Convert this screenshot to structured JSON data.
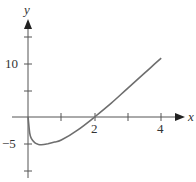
{
  "chart_data": {
    "type": "line",
    "title": "",
    "xlabel": "x",
    "ylabel": "y",
    "xlim": [
      -0.8,
      4.8
    ],
    "ylim": [
      -11,
      18.5
    ],
    "x_ticks": [
      1,
      2,
      3,
      4
    ],
    "x_tick_labels": [
      "",
      "2",
      "",
      "4"
    ],
    "y_ticks": [
      -10,
      -5,
      5,
      10,
      15
    ],
    "y_tick_labels": [
      "",
      "-5",
      "",
      "10",
      ""
    ],
    "grid": false,
    "legend": null,
    "series": [
      {
        "name": "f(x)",
        "x": [
          0.01,
          0.05,
          0.1,
          0.2,
          0.3,
          0.4,
          0.6,
          0.8,
          1.0,
          1.5,
          2.0,
          2.5,
          3.0,
          3.5,
          4.0
        ],
        "y": [
          -0.5,
          -3.0,
          -4.0,
          -4.8,
          -5.1,
          -5.2,
          -5.0,
          -4.7,
          -4.3,
          -2.4,
          0.0,
          2.6,
          5.4,
          8.2,
          11.0
        ]
      }
    ],
    "colors": {
      "curve": "#6e6e6e",
      "axes": "#555555"
    }
  },
  "labels": {
    "x_axis": "x",
    "y_axis": "y",
    "tick_x_2": "2",
    "tick_x_4": "4",
    "tick_y_10": "10",
    "tick_y_neg5": "−5"
  }
}
